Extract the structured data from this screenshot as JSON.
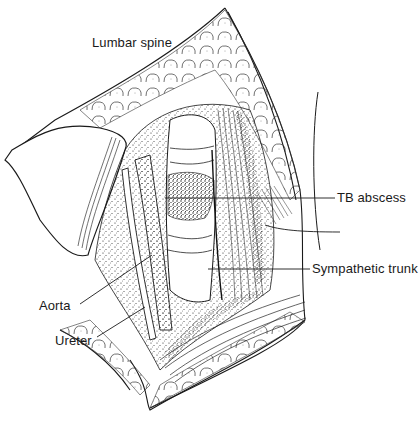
{
  "figure": {
    "labels": {
      "lumbar_spine": "Lumbar spine",
      "tb_abscess": "TB abscess",
      "sympathetic_trunk": "Sympathetic trunk",
      "aorta": "Aorta",
      "ureter": "Ureter"
    },
    "colors": {
      "ink": "#1a1a1a",
      "background": "#ffffff"
    }
  }
}
